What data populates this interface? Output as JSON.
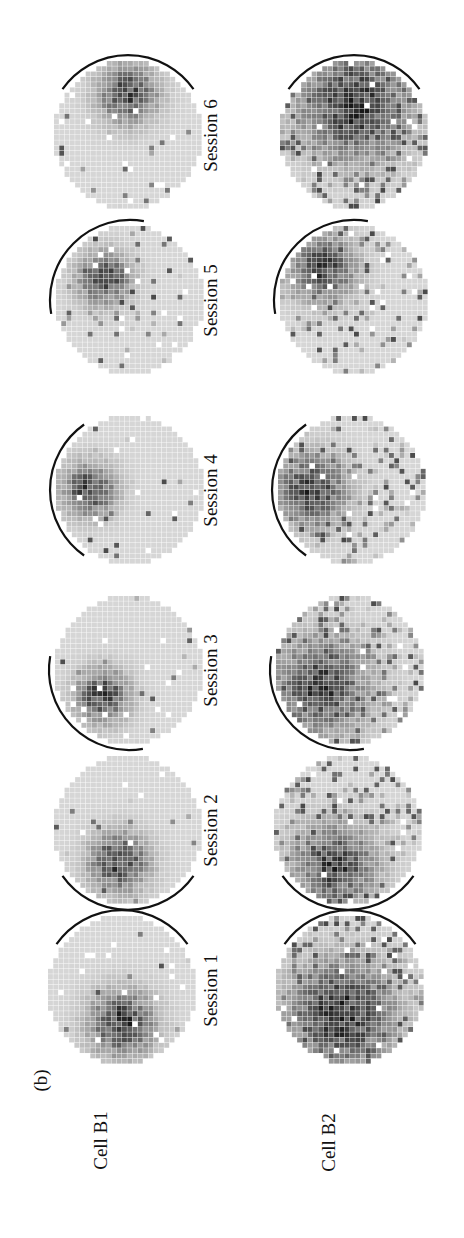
{
  "figure": {
    "panel_label": "(b)",
    "orientation": "rotated 90 degrees counter-clockwise",
    "row_labels": [
      "Cell B1",
      "Cell B2"
    ],
    "session_labels": [
      "Session 1",
      "Session 2",
      "Session 3",
      "Session 4",
      "Session 5",
      "Session 6"
    ],
    "colors": {
      "background": "#ffffff",
      "baseline_pixel": "#d4d4d4",
      "max_pixel": "#1a1a1a",
      "arc": "#111111"
    }
  },
  "chart_data": {
    "type": "heatmap",
    "title": "",
    "rows": [
      "Cell B1",
      "Cell B2"
    ],
    "columns": [
      "Session 1",
      "Session 2",
      "Session 3",
      "Session 4",
      "Session 5",
      "Session 6"
    ],
    "grid_resolution": 28,
    "maps": [
      {
        "cell": "Cell B1",
        "session": "Session 1",
        "cx": 122,
        "cy": 990,
        "field_angle": 180,
        "field_spread": 0.55,
        "field_dist": 0.45,
        "intensity": 0.95,
        "background_noise": 0.03,
        "arc_angle": 0
      },
      {
        "cell": "Cell B1",
        "session": "Session 2",
        "cx": 128,
        "cy": 830,
        "field_angle": 195,
        "field_spread": 0.5,
        "field_dist": 0.45,
        "intensity": 0.9,
        "background_noise": 0.03,
        "arc_angle": 180
      },
      {
        "cell": "Cell B1",
        "session": "Session 3",
        "cx": 129,
        "cy": 670,
        "field_angle": 225,
        "field_spread": 0.45,
        "field_dist": 0.5,
        "intensity": 0.9,
        "background_noise": 0.02,
        "arc_angle": 225
      },
      {
        "cell": "Cell B1",
        "session": "Session 4",
        "cx": 130,
        "cy": 490,
        "field_angle": 270,
        "field_spread": 0.45,
        "field_dist": 0.55,
        "intensity": 0.9,
        "background_noise": 0.03,
        "arc_angle": 270
      },
      {
        "cell": "Cell B1",
        "session": "Session 5",
        "cx": 130,
        "cy": 300,
        "field_angle": 310,
        "field_spread": 0.45,
        "field_dist": 0.45,
        "intensity": 0.85,
        "background_noise": 0.05,
        "arc_angle": 315
      },
      {
        "cell": "Cell B1",
        "session": "Session 6",
        "cx": 128,
        "cy": 135,
        "field_angle": 0,
        "field_spread": 0.5,
        "field_dist": 0.55,
        "intensity": 0.85,
        "background_noise": 0.03,
        "arc_angle": 0
      },
      {
        "cell": "Cell B2",
        "session": "Session 1",
        "cx": 350,
        "cy": 990,
        "field_angle": 200,
        "field_spread": 0.9,
        "field_dist": 0.35,
        "intensity": 1.0,
        "background_noise": 0.3,
        "arc_angle": 0
      },
      {
        "cell": "Cell B2",
        "session": "Session 2",
        "cx": 348,
        "cy": 830,
        "field_angle": 200,
        "field_spread": 0.7,
        "field_dist": 0.5,
        "intensity": 0.9,
        "background_noise": 0.25,
        "arc_angle": 180
      },
      {
        "cell": "Cell B2",
        "session": "Session 3",
        "cx": 350,
        "cy": 670,
        "field_angle": 240,
        "field_spread": 0.8,
        "field_dist": 0.45,
        "intensity": 0.9,
        "background_noise": 0.35,
        "arc_angle": 225
      },
      {
        "cell": "Cell B2",
        "session": "Session 4",
        "cx": 352,
        "cy": 490,
        "field_angle": 270,
        "field_spread": 0.6,
        "field_dist": 0.55,
        "intensity": 0.9,
        "background_noise": 0.25,
        "arc_angle": 270
      },
      {
        "cell": "Cell B2",
        "session": "Session 5",
        "cx": 354,
        "cy": 300,
        "field_angle": 315,
        "field_spread": 0.55,
        "field_dist": 0.6,
        "intensity": 0.9,
        "background_noise": 0.2,
        "arc_angle": 315
      },
      {
        "cell": "Cell B2",
        "session": "Session 6",
        "cx": 354,
        "cy": 135,
        "field_angle": 0,
        "field_spread": 0.9,
        "field_dist": 0.4,
        "intensity": 1.0,
        "background_noise": 0.35,
        "arc_angle": 0
      }
    ]
  }
}
